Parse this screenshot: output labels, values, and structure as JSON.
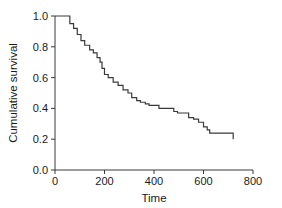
{
  "chart_data": {
    "type": "line",
    "title": "",
    "subtitle": "",
    "xlabel": "Time",
    "ylabel": "Cumulative survival",
    "xlim": [
      0,
      800
    ],
    "ylim": [
      0.0,
      1.0
    ],
    "xticks": [
      0,
      200,
      400,
      600,
      800
    ],
    "xtick_labels": [
      "0",
      "200",
      "400",
      "600",
      "800"
    ],
    "yticks": [
      0.0,
      0.2,
      0.4,
      0.6,
      0.8,
      1.0
    ],
    "ytick_labels": [
      "0.0",
      "0.2",
      "0.4",
      "0.6",
      "0.8",
      "1.0"
    ],
    "grid": false,
    "legend": false,
    "legend_position": "none",
    "line_color": "#3a3a3a",
    "line_width": 1.2,
    "step_mode": "post",
    "series": [
      {
        "name": "Cumulative survival",
        "x": [
          0,
          45,
          60,
          75,
          90,
          105,
          120,
          140,
          155,
          170,
          182,
          190,
          200,
          215,
          235,
          255,
          275,
          295,
          310,
          330,
          345,
          365,
          380,
          420,
          480,
          495,
          540,
          560,
          580,
          600,
          615,
          625,
          720
        ],
        "y": [
          1.0,
          1.0,
          0.95,
          0.92,
          0.88,
          0.84,
          0.81,
          0.78,
          0.76,
          0.73,
          0.7,
          0.66,
          0.62,
          0.6,
          0.57,
          0.55,
          0.52,
          0.5,
          0.47,
          0.45,
          0.44,
          0.43,
          0.42,
          0.4,
          0.38,
          0.37,
          0.34,
          0.33,
          0.31,
          0.28,
          0.26,
          0.24,
          0.2
        ]
      }
    ]
  },
  "axes": {
    "x_title": "Time",
    "y_title": "Cumulative survival"
  }
}
